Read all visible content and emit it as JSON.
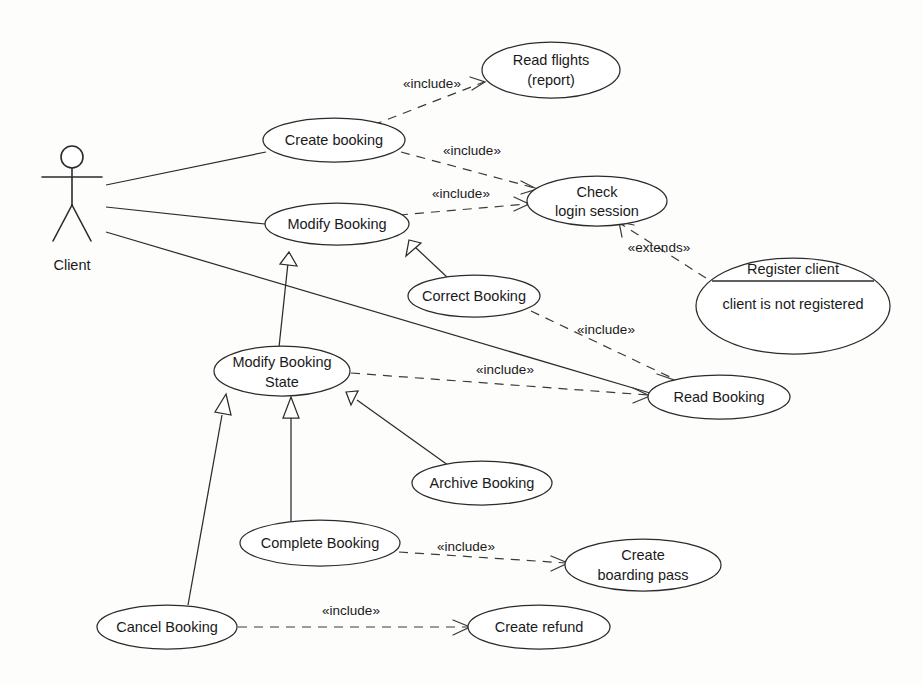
{
  "diagram": {
    "kind": "uml-use-case-diagram",
    "background_color": "#fdfdfc",
    "stroke_color": "#2b2b2b",
    "width": 923,
    "height": 685
  },
  "actors": [
    {
      "id": "client",
      "label": "Client",
      "x": 72,
      "y": 200
    }
  ],
  "use_cases": [
    {
      "id": "create-booking",
      "label_line1": "Create booking",
      "label_line2": "",
      "cx": 334,
      "cy": 140,
      "rx": 71,
      "ry": 22
    },
    {
      "id": "read-flights-report",
      "label_line1": "Read flights",
      "label_line2": "(report)",
      "cx": 551,
      "cy": 70,
      "rx": 69,
      "ry": 28
    },
    {
      "id": "modify-booking",
      "label_line1": "Modify Booking",
      "label_line2": "",
      "cx": 337,
      "cy": 224,
      "rx": 72,
      "ry": 21
    },
    {
      "id": "check-login-session",
      "label_line1": "Check",
      "label_line2": "login session",
      "cx": 597,
      "cy": 201,
      "rx": 70,
      "ry": 25
    },
    {
      "id": "register-client",
      "label_line1": "Register client",
      "label_line2": "client is not registered",
      "cx": 793,
      "cy": 306,
      "rx": 97,
      "ry": 48,
      "compartment_y": 281
    },
    {
      "id": "correct-booking",
      "label_line1": "Correct Booking",
      "label_line2": "",
      "cx": 474,
      "cy": 296,
      "rx": 66,
      "ry": 21
    },
    {
      "id": "modify-booking-state",
      "label_line1": "Modify Booking",
      "label_line2": "State",
      "cx": 282,
      "cy": 371,
      "rx": 68,
      "ry": 25
    },
    {
      "id": "read-booking",
      "label_line1": "Read Booking",
      "label_line2": "",
      "cx": 719,
      "cy": 397,
      "rx": 71,
      "ry": 22
    },
    {
      "id": "archive-booking",
      "label_line1": "Archive Booking",
      "label_line2": "",
      "cx": 482,
      "cy": 483,
      "rx": 70,
      "ry": 22
    },
    {
      "id": "complete-booking",
      "label_line1": "Complete Booking",
      "label_line2": "",
      "cx": 320,
      "cy": 543,
      "rx": 80,
      "ry": 23
    },
    {
      "id": "create-boarding-pass",
      "label_line1": "Create",
      "label_line2": "boarding pass",
      "cx": 643,
      "cy": 565,
      "rx": 78,
      "ry": 26
    },
    {
      "id": "cancel-booking",
      "label_line1": "Cancel Booking",
      "label_line2": "",
      "cx": 167,
      "cy": 627,
      "rx": 70,
      "ry": 22
    },
    {
      "id": "create-refund",
      "label_line1": "Create refund",
      "label_line2": "",
      "cx": 539,
      "cy": 627,
      "rx": 71,
      "ry": 22
    }
  ],
  "associations": [
    {
      "id": "client-create-booking",
      "from": "client",
      "to": "create-booking"
    },
    {
      "id": "client-modify-booking",
      "from": "client",
      "to": "modify-booking"
    },
    {
      "id": "client-read-booking",
      "from": "client",
      "to": "read-booking"
    }
  ],
  "generalizations": [
    {
      "id": "correct-booking-to-modify-booking",
      "from": "correct-booking",
      "to": "modify-booking"
    },
    {
      "id": "modify-booking-state-to-modify-booking",
      "from": "modify-booking-state",
      "to": "modify-booking"
    },
    {
      "id": "archive-booking-to-modify-booking-state",
      "from": "archive-booking",
      "to": "modify-booking-state"
    },
    {
      "id": "complete-booking-to-modify-booking-state",
      "from": "complete-booking",
      "to": "modify-booking-state"
    },
    {
      "id": "cancel-booking-to-modify-booking-state",
      "from": "cancel-booking",
      "to": "modify-booking-state"
    }
  ],
  "dependencies": [
    {
      "id": "create-booking-includes-read-flights",
      "from": "create-booking",
      "to": "read-flights-report",
      "stereotype": "«include»",
      "label_x": 432,
      "label_y": 88
    },
    {
      "id": "create-booking-includes-check-login",
      "from": "create-booking",
      "to": "check-login-session",
      "stereotype": "«include»",
      "label_x": 472,
      "label_y": 155
    },
    {
      "id": "modify-booking-includes-check-login",
      "from": "modify-booking",
      "to": "check-login-session",
      "stereotype": "«include»",
      "label_x": 461,
      "label_y": 198
    },
    {
      "id": "register-client-extends-check-login",
      "from": "register-client",
      "to": "check-login-session",
      "stereotype": "«extends»",
      "label_x": 659,
      "label_y": 252
    },
    {
      "id": "correct-booking-includes-read-booking",
      "from": "correct-booking",
      "to": "read-booking",
      "stereotype": "«include»",
      "label_x": 606,
      "label_y": 334
    },
    {
      "id": "modify-booking-state-includes-read-booking",
      "from": "modify-booking-state",
      "to": "read-booking",
      "stereotype": "«include»",
      "label_x": 505,
      "label_y": 374
    },
    {
      "id": "complete-booking-includes-boarding-pass",
      "from": "complete-booking",
      "to": "create-boarding-pass",
      "stereotype": "«include»",
      "label_x": 466,
      "label_y": 551
    },
    {
      "id": "cancel-booking-includes-create-refund",
      "from": "cancel-booking",
      "to": "create-refund",
      "stereotype": "«include»",
      "label_x": 351,
      "label_y": 615
    }
  ]
}
